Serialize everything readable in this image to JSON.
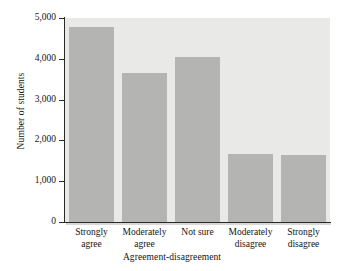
{
  "chart_data": {
    "type": "bar",
    "title": "",
    "subtitle": "",
    "xlabel": "Agreement-disagreement",
    "ylabel": "Number of students",
    "categories": [
      "Strongly agree",
      "Moderately agree",
      "Not sure",
      "Moderately disagree",
      "Strongly disagree"
    ],
    "category_lines": [
      [
        "Strongly",
        "agree"
      ],
      [
        "Moderately",
        "agree"
      ],
      [
        "Not sure"
      ],
      [
        "Moderately",
        "disagree"
      ],
      [
        "Strongly",
        "disagree"
      ]
    ],
    "values": [
      4770,
      3650,
      4050,
      1675,
      1650
    ],
    "ylim": [
      0,
      5000
    ],
    "yticks": [
      0,
      1000,
      2000,
      3000,
      4000,
      5000
    ],
    "ytick_labels": [
      "0",
      "1,000",
      "2,000",
      "3,000",
      "4,000",
      "5,000"
    ],
    "grid": false,
    "legend": "none",
    "bar_color": "#b4b4b2",
    "plot_background": "#e9e9e7",
    "axis_color": "#2a2a2a",
    "text_color": "#141414"
  }
}
